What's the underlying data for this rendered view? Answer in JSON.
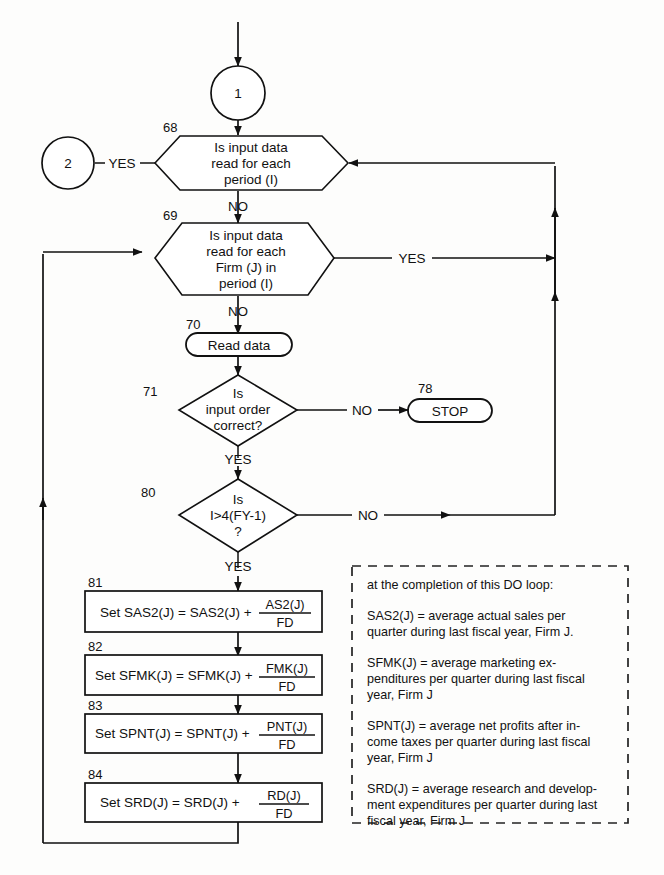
{
  "diagram": {
    "type": "flowchart"
  },
  "connectors": {
    "in_top": "1",
    "out_left": "2"
  },
  "nodes": [
    {
      "id": "n68",
      "step": "68",
      "shape": "hexagon",
      "lines": [
        "Is input data",
        "read for each",
        "period (I)"
      ],
      "yes_label": "YES",
      "no_label": "NO"
    },
    {
      "id": "n69",
      "step": "69",
      "shape": "hexagon",
      "lines": [
        "Is input data",
        "read for each",
        "Firm (J) in",
        "period (I)"
      ],
      "yes_label": "YES",
      "no_label": "NO"
    },
    {
      "id": "n70",
      "step": "70",
      "shape": "oval",
      "lines": [
        "Read data"
      ]
    },
    {
      "id": "n71",
      "step": "71",
      "shape": "diamond",
      "lines": [
        "Is",
        "input order",
        "correct?"
      ],
      "yes_label": "YES",
      "no_label": "NO"
    },
    {
      "id": "n78",
      "step": "78",
      "shape": "oval",
      "lines": [
        "STOP"
      ]
    },
    {
      "id": "n80",
      "step": "80",
      "shape": "diamond",
      "lines": [
        "Is",
        "I>4(FY-1)",
        "?"
      ],
      "yes_label": "YES",
      "no_label": "NO"
    },
    {
      "id": "n81",
      "step": "81",
      "shape": "process",
      "prefix": "Set SAS2(J) = SAS2(J) +",
      "numerator": "AS2(J)",
      "denominator": "FD"
    },
    {
      "id": "n82",
      "step": "82",
      "shape": "process",
      "prefix": "Set SFMK(J) = SFMK(J) +",
      "numerator": "FMK(J)",
      "denominator": "FD"
    },
    {
      "id": "n83",
      "step": "83",
      "shape": "process",
      "prefix": "Set SPNT(J) = SPNT(J) +",
      "numerator": "PNT(J)",
      "denominator": "FD"
    },
    {
      "id": "n84",
      "step": "84",
      "shape": "process",
      "prefix": "Set SRD(J) = SRD(J) +",
      "numerator": "RD(J)",
      "denominator": "FD"
    }
  ],
  "note": {
    "heading": "at the completion of this DO loop:",
    "entries": [
      [
        "SAS2(J) = average actual sales per",
        "quarter during last fiscal year, Firm J."
      ],
      [
        "SFMK(J) = average marketing ex-",
        "penditures per quarter during last fiscal",
        "year, Firm J"
      ],
      [
        "SPNT(J) = average net profits after in-",
        "come taxes per quarter during last fiscal",
        "year, Firm J"
      ],
      [
        "SRD(J) = average research and develop-",
        "ment expenditures per quarter during last",
        "fiscal year, Firm J"
      ]
    ]
  },
  "colors": {
    "stroke": "#111111",
    "background": "#fdfdfc",
    "note_border": "#222222"
  }
}
